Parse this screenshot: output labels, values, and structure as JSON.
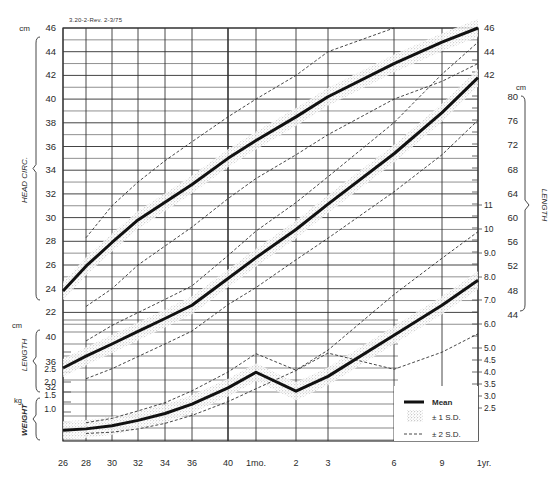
{
  "form_id": "3.20-2-Rev. 2-3/75",
  "legend": {
    "mean": "Mean",
    "sd1": "± 1 S.D.",
    "sd2": "± 2 S.D."
  },
  "axis_titles": {
    "head_circ": "HEAD CIRC.",
    "length_left": "LENGTH",
    "weight": "WEIGHT",
    "length_right": "LENGTH",
    "unit_cm": "cm",
    "unit_kg": "kg"
  },
  "chart_data": {
    "type": "line",
    "xlabel": "Gestational age (weeks) / Postnatal age",
    "x_tick_labels": [
      "26",
      "28",
      "30",
      "32",
      "34",
      "36",
      "40",
      "1mo.",
      "2",
      "3",
      "6",
      "9",
      "1yr."
    ],
    "x_tick_pos": [
      63,
      86,
      112,
      138,
      165,
      192,
      228,
      256,
      296,
      328,
      394,
      442,
      478
    ],
    "grid": true,
    "legend_position": "lower right",
    "axes": {
      "head_circ_left_cm": {
        "ticks": [
          46,
          44,
          42,
          40,
          38,
          36,
          34,
          32,
          30,
          28,
          26,
          24,
          22
        ],
        "range": [
          22,
          46
        ]
      },
      "length_left_cm": {
        "ticks": [
          40,
          36,
          32
        ],
        "range": [
          32,
          42
        ]
      },
      "weight_left_kg": {
        "ticks": [
          2.5,
          2.0,
          1.5,
          1.0
        ]
      },
      "head_circ_right_cm": {
        "ticks": [
          46,
          44,
          42
        ]
      },
      "length_right_cm": {
        "ticks": [
          80,
          76,
          72,
          68,
          64,
          60,
          56,
          52,
          48,
          44
        ]
      },
      "weight_right_kg": {
        "ticks": [
          11,
          10,
          9.0,
          8.0,
          7.0,
          6.0,
          5.0,
          4.5,
          4.0,
          3.5,
          3.0,
          2.5
        ]
      }
    },
    "series": [
      {
        "name": "Head circumference (cm)",
        "x": [
          "26",
          "28",
          "30",
          "32",
          "34",
          "36",
          "40",
          "1mo.",
          "2",
          "3",
          "6",
          "9",
          "1yr."
        ],
        "mean": [
          23.8,
          25.9,
          27.9,
          29.8,
          31.3,
          32.8,
          35.0,
          36.5,
          38.5,
          40.2,
          43.0,
          44.8,
          46.0
        ],
        "minus2sd": [
          null,
          22.5,
          24.0,
          26.0,
          27.6,
          29.2,
          31.6,
          33.3,
          35.3,
          37.0,
          40.0,
          41.5,
          43.0
        ],
        "plus2sd": [
          null,
          28.3,
          31.0,
          33.0,
          34.8,
          36.4,
          38.5,
          40.0,
          42.0,
          44.0,
          46.0,
          null,
          null
        ]
      },
      {
        "name": "Length (cm)",
        "x": [
          "26",
          "28",
          "30",
          "32",
          "34",
          "36",
          "40",
          "1mo.",
          "2",
          "3",
          "6",
          "9",
          "1yr."
        ],
        "mean": [
          35.5,
          37.5,
          39.5,
          41.5,
          43.5,
          45.5,
          49.5,
          52.5,
          56.5,
          60.0,
          67.0,
          72.5,
          77.0
        ],
        "minus2sd": [
          null,
          33.8,
          35.5,
          37.5,
          39.5,
          41.5,
          45.5,
          48.0,
          52.0,
          55.0,
          61.5,
          66.5,
          71.0
        ],
        "plus2sd": [
          null,
          40.0,
          42.5,
          44.5,
          46.5,
          48.5,
          53.0,
          56.5,
          60.5,
          64.0,
          71.5,
          78.0,
          82.0
        ]
      },
      {
        "name": "Weight (kg)",
        "x": [
          "26",
          "28",
          "30",
          "32",
          "34",
          "36",
          "40",
          "1mo.",
          "2",
          "3",
          "6",
          "9",
          "1yr."
        ],
        "mean": [
          0.85,
          1.0,
          1.25,
          1.6,
          2.0,
          2.5,
          3.3,
          4.0,
          5.0,
          5.8,
          7.7,
          9.0,
          10.0
        ],
        "minus2sd": [
          null,
          0.7,
          0.85,
          1.1,
          1.45,
          1.9,
          2.6,
          3.2,
          4.0,
          4.7,
          6.2,
          7.0,
          7.8
        ],
        "plus2sd": [
          null,
          1.4,
          1.7,
          2.15,
          2.6,
          3.2,
          4.1,
          4.9,
          6.0,
          7.0,
          9.5,
          11.0,
          12.0
        ]
      }
    ]
  }
}
